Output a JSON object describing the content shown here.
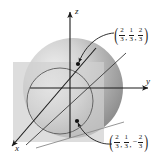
{
  "figure": {
    "background_color": "#ffffff",
    "axes": {
      "x_label": "x",
      "y_label": "y",
      "z_label": "z",
      "line_color": "#1a1a1a"
    },
    "sphere": {
      "name": "shaded-sphere",
      "fill_light": "#e8e8e8",
      "fill_dark": "#8f8f8f"
    },
    "plane": {
      "name": "translucent-square-plane",
      "fill": "#d4d4d4"
    },
    "circle": {
      "name": "intersection-circle",
      "stroke": "#4a4a4a"
    },
    "points": [
      {
        "name": "upper-point",
        "coords": [
          "2",
          "3",
          "1",
          "3",
          "2",
          "3"
        ],
        "sign": "",
        "x_num": "2",
        "x_den": "3",
        "y_num": "1",
        "y_den": "3",
        "z_num": "2",
        "z_den": "3",
        "z_sign": ""
      },
      {
        "name": "lower-point",
        "x_num": "2",
        "x_den": "3",
        "y_num": "1",
        "y_den": "3",
        "z_num": "2",
        "z_den": "3",
        "z_sign": "−"
      }
    ],
    "punctuation": {
      "open_paren": "(",
      "close_paren": ")",
      "comma": ","
    }
  }
}
